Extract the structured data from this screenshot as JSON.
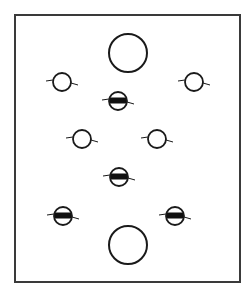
{
  "diagram": {
    "title": "",
    "frame": {
      "x": 15,
      "y": 15,
      "width": 225,
      "height": 267,
      "stroke": "#3a3a3a",
      "stroke_width": 2
    },
    "colors": {
      "stroke": "#1a1a1a",
      "band": "#111111",
      "background": "#ffffff"
    },
    "large_circles": [
      {
        "id": "large-top",
        "cx": 128,
        "cy": 53,
        "r": 19
      },
      {
        "id": "large-bottom",
        "cx": 128,
        "cy": 245,
        "r": 19
      }
    ],
    "open_circles": [
      {
        "id": "open-upper-left",
        "cx": 62,
        "cy": 82,
        "r": 9
      },
      {
        "id": "open-upper-right",
        "cx": 194,
        "cy": 82,
        "r": 9
      },
      {
        "id": "open-mid-left",
        "cx": 82,
        "cy": 139,
        "r": 9
      },
      {
        "id": "open-mid-right",
        "cx": 157,
        "cy": 139,
        "r": 9
      }
    ],
    "banded_circles": [
      {
        "id": "banded-upper-center",
        "cx": 118,
        "cy": 101,
        "r": 9
      },
      {
        "id": "banded-lower-center",
        "cx": 119,
        "cy": 177,
        "r": 9
      },
      {
        "id": "banded-lower-left",
        "cx": 63,
        "cy": 216,
        "r": 9
      },
      {
        "id": "banded-lower-right",
        "cx": 175,
        "cy": 216,
        "r": 9
      }
    ]
  }
}
